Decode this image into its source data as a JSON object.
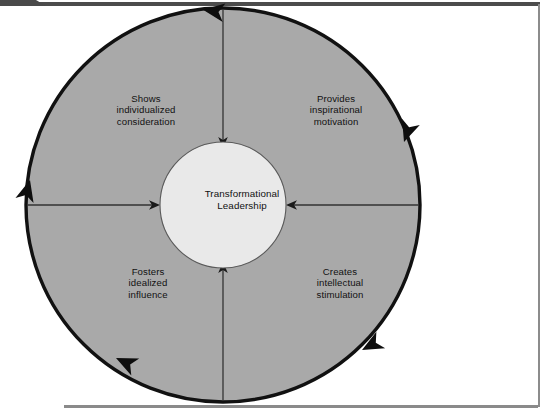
{
  "figure": {
    "type": "cycle-diagram",
    "title": "Transformational Leadership",
    "hub": {
      "label": "Transformational\nLeadership",
      "line1": "Transformational",
      "line2": "Leadership",
      "fill": "#e9e9e9"
    },
    "ring": {
      "fill": "#a9a9a9",
      "stroke": "#111111",
      "direction": "counterclockwise",
      "arrowhead_count": 5
    },
    "quadrants": [
      {
        "position": "top-left",
        "label": "Shows\nindividualized\nconsideration",
        "line1": "Shows",
        "line2": "individualized",
        "line3": "consideration"
      },
      {
        "position": "top-right",
        "label": "Provides\ninspirational\nmotivation",
        "line1": "Provides",
        "line2": "inspirational",
        "line3": "motivation"
      },
      {
        "position": "bottom-left",
        "label": "Fosters\nidealized\ninfluence",
        "line1": "Fosters",
        "line2": "idealized",
        "line3": "influence"
      },
      {
        "position": "bottom-right",
        "label": "Creates\nintellectual\nstimulation",
        "line1": "Creates",
        "line2": "intellectual",
        "line3": "stimulation"
      }
    ],
    "spokes": [
      {
        "name": "top-spoke",
        "direction": "points-down-to-hub"
      },
      {
        "name": "left-spoke",
        "direction": "points-right-to-hub"
      },
      {
        "name": "right-spoke",
        "direction": "points-left-to-hub"
      },
      {
        "name": "bottom-spoke",
        "direction": "points-up-to-hub"
      }
    ]
  },
  "chrome": {
    "top_rule_color": "#4c4c4c",
    "right_rule_color": "#8c8c8c",
    "bottom_rule_color": "#8a8a8a"
  }
}
